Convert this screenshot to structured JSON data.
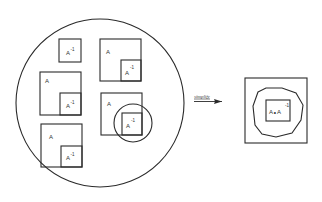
{
  "diagram": {
    "colors": {
      "stroke": "#2a2a2a",
      "text": "#333333",
      "background": "#ffffff"
    },
    "left_group": {
      "container": "circle",
      "items": [
        {
          "id": "inv-alone",
          "outer_label": "",
          "inner_label": "A",
          "inner_sup": "-1"
        },
        {
          "id": "pair-1",
          "outer_label": "A",
          "inner_label": "A",
          "inner_sup": "-1"
        },
        {
          "id": "pair-2",
          "outer_label": "A",
          "inner_label": "A",
          "inner_sup": "-1"
        },
        {
          "id": "pair-3",
          "outer_label": "A",
          "inner_label": "A",
          "inner_sup": "-1"
        },
        {
          "id": "pair-4-highlighted",
          "outer_label": "A",
          "inner_label": "A",
          "inner_sup": "-1"
        }
      ]
    },
    "arrow": {
      "label": "simplify"
    },
    "right_group": {
      "container": "square",
      "inner_label": "A∘A",
      "inner_sup": "-1"
    }
  }
}
